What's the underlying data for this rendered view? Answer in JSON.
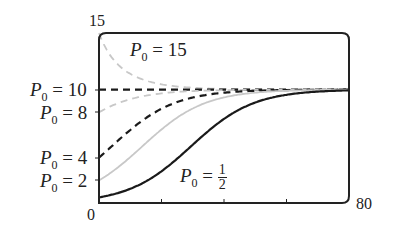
{
  "chart_data": {
    "type": "line",
    "title": "",
    "xlabel": "",
    "ylabel": "",
    "xlim": [
      0,
      80
    ],
    "ylim": [
      0,
      15
    ],
    "x_tick_labels": [
      "0",
      "80"
    ],
    "y_tick_labels": [
      "15"
    ],
    "x_minor_ticks": [
      20,
      40,
      60
    ],
    "grid": false,
    "model": "logistic P(t) = K / (1 + ((K - P0)/P0) e^(-r t)), K = 10, r ≈ 0.1",
    "carrying_capacity": 10,
    "series": [
      {
        "name": "P0 = 15",
        "p0": 15,
        "style": "gray-dashed",
        "values_at_t": {
          "0": 15,
          "10": 11.6,
          "20": 10.6,
          "40": 10.1,
          "80": 10
        }
      },
      {
        "name": "P0 = 10",
        "p0": 10,
        "style": "black-dashed",
        "values_at_t": {
          "0": 10,
          "80": 10
        }
      },
      {
        "name": "P0 = 8",
        "p0": 8,
        "style": "gray-dashed",
        "values_at_t": {
          "0": 8,
          "10": 9.2,
          "20": 9.7,
          "40": 10,
          "80": 10
        }
      },
      {
        "name": "P0 = 4",
        "p0": 4,
        "style": "black-dashed",
        "values_at_t": {
          "0": 4,
          "10": 6.4,
          "20": 8.3,
          "40": 9.7,
          "80": 10
        }
      },
      {
        "name": "P0 = 2",
        "p0": 2,
        "style": "gray-solid",
        "values_at_t": {
          "0": 2,
          "10": 4.0,
          "20": 6.5,
          "40": 9.3,
          "80": 10
        }
      },
      {
        "name": "P0 = 1/2",
        "p0": 0.5,
        "style": "black-solid",
        "values_at_t": {
          "0": 0.5,
          "10": 1.3,
          "20": 2.8,
          "30": 5.1,
          "40": 7.4,
          "60": 9.5,
          "80": 10
        }
      }
    ],
    "annotations": [
      "P0 = 15",
      "P0 = 10",
      "P0 = 8",
      "P0 = 4",
      "P0 = 2",
      "P0 = 1/2"
    ]
  },
  "labels": {
    "y_top": "15",
    "x_left": "0",
    "x_right": "80",
    "p0_15": {
      "var": "P",
      "sub": "0",
      "eq": "= 15"
    },
    "p0_10": {
      "var": "P",
      "sub": "0",
      "eq": "= 10"
    },
    "p0_8": {
      "var": "P",
      "sub": "0",
      "eq": "= 8"
    },
    "p0_4": {
      "var": "P",
      "sub": "0",
      "eq": "= 4"
    },
    "p0_2": {
      "var": "P",
      "sub": "0",
      "eq": "= 2"
    },
    "p0_half": {
      "var": "P",
      "sub": "0",
      "eq": "=",
      "num": "1",
      "den": "2"
    }
  }
}
